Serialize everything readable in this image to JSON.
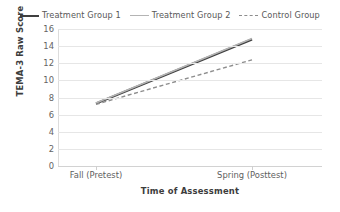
{
  "chart_data": {
    "type": "line",
    "title": "",
    "xlabel": "Time of Assessment",
    "ylabel": "TEMA-3 Raw Score",
    "categories": [
      "Fall (Pretest)",
      "Spring (Posttest)"
    ],
    "ylim": [
      0,
      16
    ],
    "ytick_labels": [
      "16",
      "14",
      "12",
      "10",
      "8",
      "6",
      "4",
      "2",
      "0"
    ],
    "ytick_values": [
      16,
      14,
      12,
      10,
      8,
      6,
      4,
      2,
      0
    ],
    "grid": true,
    "legend_position": "top",
    "series": [
      {
        "name": "Treatment Group 1",
        "values": [
          7.3,
          14.8
        ],
        "style": "solid",
        "color": "#3f3f3f",
        "width": 2.4
      },
      {
        "name": "Treatment Group 2",
        "values": [
          7.35,
          14.9
        ],
        "style": "solid",
        "color": "#b4b4b4",
        "width": 1.6
      },
      {
        "name": "Control Group",
        "values": [
          7.2,
          12.4
        ],
        "style": "dashed",
        "color": "#8d8d8d",
        "width": 1.4
      }
    ]
  },
  "legend": {
    "entries": [
      {
        "label": "Treatment Group 1",
        "swatch": "solid-dark"
      },
      {
        "label": "Treatment Group 2",
        "swatch": "solid-light"
      },
      {
        "label": "Control Group",
        "swatch": "dashed"
      }
    ]
  },
  "axes": {
    "y_title": "TEMA-3 Raw Score",
    "x_title": "Time of Assessment",
    "x_labels": [
      "Fall (Pretest)",
      "Spring (Posttest)"
    ],
    "y_labels": [
      "16",
      "14",
      "12",
      "10",
      "8",
      "6",
      "4",
      "2",
      "0"
    ]
  }
}
